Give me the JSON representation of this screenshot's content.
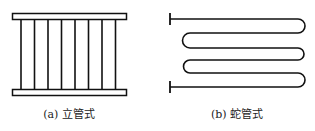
{
  "figures": [
    {
      "id": "a",
      "caption": "(a) 立管式",
      "type": "vertical-tube",
      "tube_count": 8
    },
    {
      "id": "b",
      "caption": "(b) 蛇管式",
      "type": "serpentine-tube",
      "rows": 6
    }
  ],
  "colors": {
    "stroke": "#111111",
    "background": "#ffffff"
  }
}
